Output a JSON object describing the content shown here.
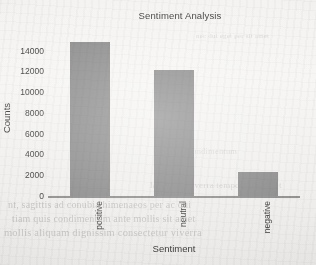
{
  "chart_data": {
    "type": "bar",
    "title": "Sentiment Analysis",
    "xlabel": "Sentiment",
    "ylabel": "Counts",
    "categories": [
      "positive",
      "neutral",
      "negative"
    ],
    "values": [
      14800,
      12100,
      2300
    ],
    "yticks": [
      14000,
      12000,
      10000,
      8000,
      6000,
      4000,
      2000,
      0
    ],
    "ylim": [
      0,
      15400
    ],
    "grid": false,
    "legend": null,
    "bar_color": "#8a8a8a",
    "text_color": "#3a3a3a",
    "background_color": "#f4f3f1"
  },
  "background_text": {
    "line1": "nt, sagittis ad conubia himenaeos per ac dui",
    "line2": "tiam quis condimentum ante mollis sit amet",
    "line3": "mollis aliquam dignissim consectetur viverra",
    "line4": "lacus sed viverra tempor imperdiet",
    "line5": "urna condimentum",
    "column": "nec  dui  eget  per  sit  amet"
  }
}
